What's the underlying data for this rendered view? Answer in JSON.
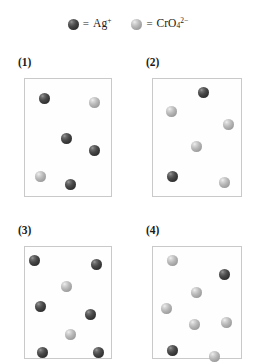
{
  "legend": {
    "entries": [
      {
        "icon": "dark-sphere-icon",
        "equals": "=",
        "species_html": "Ag<sup>+</sup>",
        "species_text": "Ag+",
        "color": "#3a3a3a",
        "name": "silver-ion"
      },
      {
        "icon": "light-sphere-icon",
        "equals": "=",
        "species_html": "CrO<sub>4</sub><sup>2−</sup>",
        "species_text": "CrO4 2-",
        "color": "#b5b5b5",
        "name": "chromate-ion"
      }
    ]
  },
  "colors": {
    "dark_sphere": "#3a3a3a",
    "light_sphere": "#b5b5b5",
    "box_border": "#c9c9c9",
    "background": "#ffffff",
    "text": "#1a1a1a"
  },
  "panels": [
    {
      "label": "(1)",
      "name": "panel-1",
      "counts": {
        "dark": 4,
        "light": 2,
        "total": 6
      },
      "spheres": [
        {
          "type": "dark",
          "x": 14,
          "y": 14
        },
        {
          "type": "light",
          "x": 64,
          "y": 18
        },
        {
          "type": "dark",
          "x": 36,
          "y": 54
        },
        {
          "type": "dark",
          "x": 64,
          "y": 66
        },
        {
          "type": "light",
          "x": 10,
          "y": 92
        },
        {
          "type": "dark",
          "x": 40,
          "y": 100
        }
      ]
    },
    {
      "label": "(2)",
      "name": "panel-2",
      "counts": {
        "dark": 2,
        "light": 4,
        "total": 6
      },
      "spheres": [
        {
          "type": "dark",
          "x": 45,
          "y": 8
        },
        {
          "type": "light",
          "x": 13,
          "y": 27
        },
        {
          "type": "light",
          "x": 70,
          "y": 40
        },
        {
          "type": "light",
          "x": 38,
          "y": 62
        },
        {
          "type": "dark",
          "x": 14,
          "y": 92
        },
        {
          "type": "light",
          "x": 66,
          "y": 98
        }
      ]
    },
    {
      "label": "(3)",
      "name": "panel-3",
      "counts": {
        "dark": 6,
        "light": 2,
        "total": 8
      },
      "spheres": [
        {
          "type": "dark",
          "x": 4,
          "y": 8
        },
        {
          "type": "dark",
          "x": 66,
          "y": 12
        },
        {
          "type": "light",
          "x": 36,
          "y": 34
        },
        {
          "type": "dark",
          "x": 10,
          "y": 54
        },
        {
          "type": "dark",
          "x": 60,
          "y": 62
        },
        {
          "type": "light",
          "x": 40,
          "y": 82
        },
        {
          "type": "dark",
          "x": 12,
          "y": 100
        },
        {
          "type": "dark",
          "x": 68,
          "y": 100
        }
      ]
    },
    {
      "label": "(4)",
      "name": "panel-4",
      "counts": {
        "dark": 2,
        "light": 6,
        "total": 8
      },
      "spheres": [
        {
          "type": "light",
          "x": 14,
          "y": 8
        },
        {
          "type": "dark",
          "x": 66,
          "y": 22
        },
        {
          "type": "light",
          "x": 38,
          "y": 40
        },
        {
          "type": "light",
          "x": 8,
          "y": 56
        },
        {
          "type": "light",
          "x": 36,
          "y": 72
        },
        {
          "type": "light",
          "x": 68,
          "y": 70
        },
        {
          "type": "dark",
          "x": 14,
          "y": 98
        },
        {
          "type": "light",
          "x": 56,
          "y": 104
        }
      ]
    }
  ]
}
